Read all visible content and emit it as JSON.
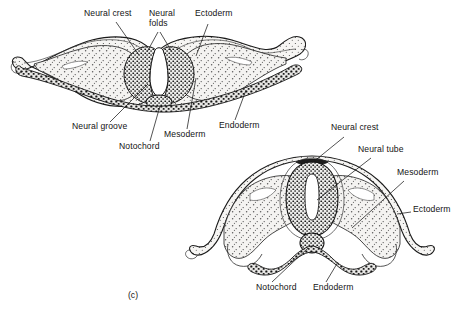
{
  "figure": {
    "caption_letter": "(c)",
    "panels": [
      {
        "id": "upper",
        "name": "neural-groove-stage",
        "labels": [
          {
            "name": "neural-crest",
            "text": "Neural crest",
            "x": 84,
            "y": 13
          },
          {
            "name": "neural-folds",
            "text": "Neural folds",
            "x": 149,
            "y": 13,
            "wrap": true
          },
          {
            "name": "ectoderm",
            "text": "Ectoderm",
            "x": 195,
            "y": 13
          },
          {
            "name": "neural-groove",
            "text": "Neural groove",
            "x": 72,
            "y": 126
          },
          {
            "name": "notochord",
            "text": "Notochord",
            "x": 119,
            "y": 146
          },
          {
            "name": "mesoderm",
            "text": "Mesoderm",
            "x": 164,
            "y": 134
          },
          {
            "name": "endoderm",
            "text": "Endoderm",
            "x": 219,
            "y": 125
          }
        ]
      },
      {
        "id": "lower",
        "name": "neural-tube-stage",
        "labels": [
          {
            "name": "neural-crest",
            "text": "Neural crest",
            "x": 331,
            "y": 127
          },
          {
            "name": "neural-tube",
            "text": "Neural tube",
            "x": 358,
            "y": 149
          },
          {
            "name": "mesoderm",
            "text": "Mesoderm",
            "x": 397,
            "y": 172
          },
          {
            "name": "ectoderm",
            "text": "Ectoderm",
            "x": 413,
            "y": 209
          },
          {
            "name": "notochord",
            "text": "Notochord",
            "x": 256,
            "y": 287
          },
          {
            "name": "endoderm",
            "text": "Endoderm",
            "x": 313,
            "y": 287
          }
        ]
      }
    ],
    "colors": {
      "background": "#ffffff",
      "outline": "#1a1a1a",
      "tissue_fill": "#f2f1ef",
      "stipple": "#555555",
      "dense_cells": "#222222",
      "leader_line": "#1a1a1a"
    },
    "structures": {
      "upper": [
        "ectoderm",
        "neural folds",
        "neural crest",
        "neural groove",
        "mesoderm",
        "notochord",
        "endoderm"
      ],
      "lower": [
        "ectoderm",
        "neural crest",
        "neural tube",
        "mesoderm",
        "notochord",
        "endoderm"
      ]
    }
  }
}
